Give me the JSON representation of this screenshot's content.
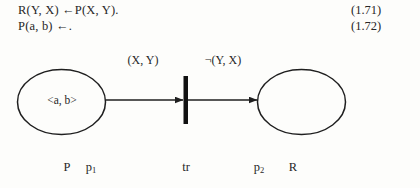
{
  "formulas": [
    {
      "text": "R(Y, X) ←P(X, Y).",
      "number": "(1.71)"
    },
    {
      "text": "P(a, b) ←.",
      "number": "(1.72)"
    }
  ],
  "diagram": {
    "type": "petri-net",
    "places": [
      {
        "id": "p1",
        "token": "<a, b>",
        "predicate": "P",
        "place_label": "p",
        "place_subscript": "1"
      },
      {
        "id": "p2",
        "token": "",
        "predicate": "R",
        "place_label": "p",
        "place_subscript": "2"
      }
    ],
    "transition": {
      "id": "tr",
      "label": "tr"
    },
    "arcs": [
      {
        "from": "p1",
        "to": "tr",
        "label": "(X, Y)"
      },
      {
        "from": "tr",
        "to": "p2",
        "label": "¬(Y, X)"
      }
    ]
  },
  "colors": {
    "ink": "#272727",
    "stroke": "#1f1f1f",
    "page": "#fdfdfb"
  }
}
